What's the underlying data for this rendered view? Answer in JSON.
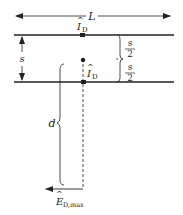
{
  "diagram": {
    "width_label": "L",
    "spacing_label": "s",
    "half_spacing_num": "s",
    "half_spacing_den": "2",
    "current_top": {
      "symbol": "I",
      "hat": "^",
      "subscript": "D"
    },
    "current_bottom": {
      "symbol": "I",
      "hat": "^",
      "subscript": "D"
    },
    "distance_label": "d",
    "field_label": {
      "symbol": "E",
      "hat": "^",
      "subscript": "D,max"
    },
    "colors": {
      "line": "#222222",
      "background": "#ffffff"
    }
  }
}
